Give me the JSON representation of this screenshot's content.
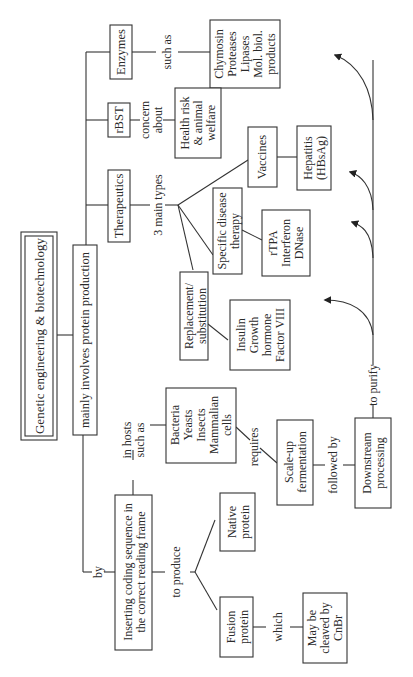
{
  "title": "Genetic engineering & biotechnology",
  "nodes": {
    "main": "mainly involves protein production",
    "therapeutics": "Therapeutics",
    "rbst": "rBST",
    "enzymes": "Enzymes",
    "enzyme_products": [
      "Chymosin",
      "Proteases",
      "Lipases",
      "Mol. biol.",
      "products"
    ],
    "health": [
      "Health risk",
      "& animal",
      "welfare"
    ],
    "replacement": [
      "Replacement/",
      "substitution"
    ],
    "specific": [
      "Specific disease",
      "therapy"
    ],
    "vaccines": "Vaccines",
    "replacement_examples": [
      "Insulin",
      "Growth",
      "hormone",
      "Factor VIII"
    ],
    "specific_examples": [
      "rTPA",
      "Interferon",
      "DNase"
    ],
    "vaccine_examples": [
      "Hepatitis",
      "(HBsAg)"
    ],
    "inserting": [
      "Inserting coding sequence in",
      "the correct reading frame"
    ],
    "hosts": [
      "Bacteria",
      "Yeasts",
      "Insects",
      "Mammalian",
      "cells"
    ],
    "native": [
      "Native",
      "protein"
    ],
    "fusion": [
      "Fusion",
      "protein"
    ],
    "cleaved": [
      "May be",
      "cleaved by",
      "CnBr"
    ],
    "scaleup": [
      "Scale-up",
      "fermentation"
    ],
    "downstream": [
      "Downstream",
      "processing"
    ]
  },
  "edge_labels": {
    "such_as": "such as",
    "concern_about": [
      "concern",
      "about"
    ],
    "three_main_types": "3 main types",
    "by": "by",
    "in_hosts": [
      "in hosts",
      "such as"
    ],
    "to_produce": "to produce",
    "which": "which",
    "requires": "requires",
    "followed_by": "followed by",
    "to_purify": "to purify"
  }
}
